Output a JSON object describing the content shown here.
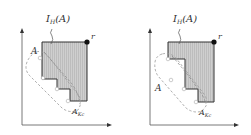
{
  "panels": [
    {
      "id": "left",
      "labels": {
        "ideal": "I",
        "ideal_sub": "H",
        "ideal_arg": "(A)",
        "point_r": "r",
        "set_A": "A",
        "set_AKc": "A",
        "set_AKc_sub": "Kc"
      }
    },
    {
      "id": "right",
      "labels": {
        "ideal": "I",
        "ideal_sub": "H",
        "ideal_arg": "(A)",
        "point_r": "r",
        "set_A": "A",
        "set_AKc": "A",
        "set_AKc_sub": "Kc"
      }
    }
  ],
  "colors": {
    "fill": "#c8c8c8",
    "stroke": "#333333",
    "dashed": "#999999",
    "axis": "#555555"
  }
}
